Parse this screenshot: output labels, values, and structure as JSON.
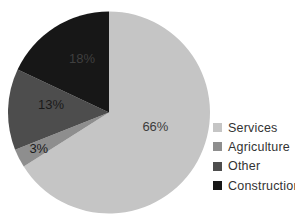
{
  "chart_data": {
    "type": "pie",
    "title": "",
    "categories": [
      "Services",
      "Agriculture",
      "Other",
      "Construction"
    ],
    "values": [
      66,
      3,
      13,
      18
    ],
    "slice_labels": [
      "66%",
      "3%",
      "13%",
      "18%"
    ],
    "colors": [
      "#c5c5c5",
      "#8e8e8e",
      "#4d4d4d",
      "#171717"
    ],
    "slice_label_colors": [
      "#3c3c3c",
      "#1c1c1c",
      "#1a1a1a",
      "#3f3f3f"
    ],
    "start_angle_deg": 0,
    "direction": "clockwise",
    "legend_position": "right",
    "label_radius_fractions": [
      0.48,
      0.78,
      0.58,
      0.6
    ],
    "label_angle_offsets_deg": [
      -12,
      0,
      6,
      6
    ]
  },
  "legend": {
    "items": [
      {
        "label": "Services",
        "color": "#c5c5c5"
      },
      {
        "label": "Agriculture",
        "color": "#8e8e8e"
      },
      {
        "label": "Other",
        "color": "#4d4d4d"
      },
      {
        "label": "Construction",
        "color": "#171717"
      }
    ]
  }
}
